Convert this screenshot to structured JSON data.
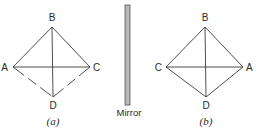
{
  "figure": {
    "panels": [
      {
        "id": "a",
        "caption": "(a)",
        "vertices": {
          "B": {
            "label": "B",
            "x": 52,
            "y": 27
          },
          "A": {
            "label": "A",
            "x": 13,
            "y": 67
          },
          "C": {
            "label": "C",
            "x": 90,
            "y": 67
          },
          "D": {
            "label": "D",
            "x": 53,
            "y": 97
          }
        },
        "edges": [
          {
            "from": "B",
            "to": "A",
            "style": "solid"
          },
          {
            "from": "B",
            "to": "C",
            "style": "solid"
          },
          {
            "from": "B",
            "to": "D",
            "style": "solid"
          },
          {
            "from": "A",
            "to": "C",
            "style": "solid"
          },
          {
            "from": "A",
            "to": "D",
            "style": "dashed"
          },
          {
            "from": "C",
            "to": "D",
            "style": "dashed"
          }
        ]
      },
      {
        "id": "b",
        "caption": "(b)",
        "vertices": {
          "B": {
            "label": "B",
            "x": 205,
            "y": 27
          },
          "C": {
            "label": "C",
            "x": 166,
            "y": 67
          },
          "A": {
            "label": "A",
            "x": 243,
            "y": 67
          },
          "D": {
            "label": "D",
            "x": 206,
            "y": 97
          }
        },
        "edges": [
          {
            "from": "B",
            "to": "C",
            "style": "solid"
          },
          {
            "from": "B",
            "to": "A",
            "style": "solid"
          },
          {
            "from": "B",
            "to": "D",
            "style": "solid"
          },
          {
            "from": "C",
            "to": "A",
            "style": "solid"
          },
          {
            "from": "C",
            "to": "D",
            "style": "solid"
          },
          {
            "from": "A",
            "to": "D",
            "style": "solid"
          }
        ]
      }
    ],
    "mirror": {
      "label": "Mirror",
      "color": "#b8b8b8"
    }
  }
}
